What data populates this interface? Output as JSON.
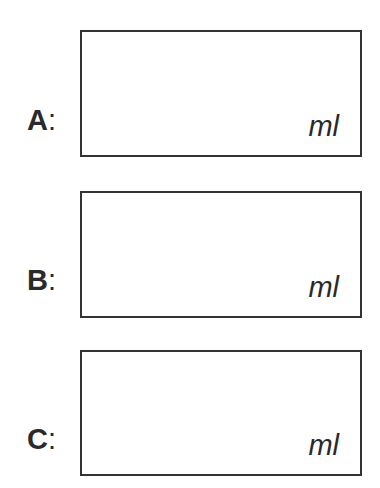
{
  "fields": [
    {
      "label": "A",
      "separator": ":",
      "value": "",
      "unit": "ml"
    },
    {
      "label": "B",
      "separator": ":",
      "value": "",
      "unit": "ml"
    },
    {
      "label": "C",
      "separator": ":",
      "value": "",
      "unit": "ml"
    }
  ],
  "colors": {
    "border": "#333333",
    "text": "#2a2a2a",
    "background": "#ffffff"
  }
}
